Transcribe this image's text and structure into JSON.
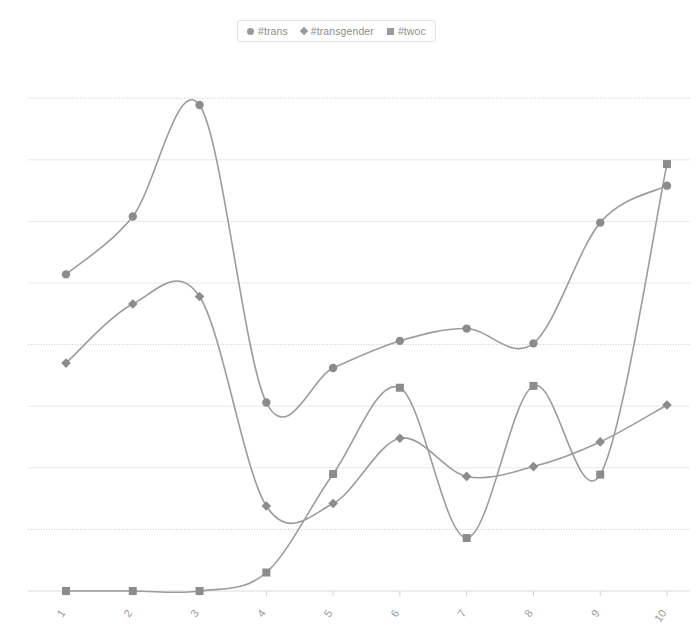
{
  "chart_data": {
    "type": "line",
    "title": "",
    "subtitle": "",
    "xlabel": "",
    "ylabel": "",
    "x": [
      1,
      2,
      3,
      4,
      5,
      6,
      7,
      8,
      9,
      10
    ],
    "categories": [
      "1",
      "2",
      "3",
      "4",
      "5",
      "6",
      "7",
      "8",
      "9",
      "10"
    ],
    "xlim": [
      1,
      10
    ],
    "ylim": [
      0,
      8
    ],
    "grid": true,
    "gridlines_y": [
      0,
      1,
      2,
      3,
      4,
      5,
      6,
      7,
      8
    ],
    "y_tick_labels_visible": false,
    "legend_position": "top-center",
    "series": [
      {
        "name": "#trans",
        "marker": "circle",
        "color": "#9c9c9c",
        "values": [
          5.14,
          6.08,
          7.89,
          3.06,
          3.62,
          4.06,
          4.26,
          4.02,
          5.98,
          6.58
        ]
      },
      {
        "name": "#transgender",
        "marker": "diamond",
        "color": "#9c9c9c",
        "values": [
          3.7,
          4.66,
          4.78,
          1.38,
          1.42,
          2.48,
          1.86,
          2.02,
          2.42,
          3.02
        ]
      },
      {
        "name": "#twoc",
        "marker": "square",
        "color": "#9c9c9c",
        "values": [
          0.0,
          0.0,
          0.0,
          0.3,
          1.9,
          3.3,
          0.86,
          3.33,
          1.89,
          6.93
        ]
      }
    ]
  },
  "legend": {
    "items": [
      {
        "label": "#trans",
        "marker": "circle-marker-icon"
      },
      {
        "label": "#transgender",
        "marker": "diamond-marker-icon"
      },
      {
        "label": "#twoc",
        "marker": "square-marker-icon"
      }
    ]
  },
  "axis": {
    "x_tick_labels": [
      "1",
      "2",
      "3",
      "4",
      "5",
      "6",
      "7",
      "8",
      "9",
      "10"
    ]
  },
  "colors": {
    "series": "#9c9c9c",
    "marker": "#8c8c8c",
    "grid": "#e8e8ee",
    "grid_dotted": "#c9c9cf",
    "axis": "#dcdcdc",
    "text": "#9b9b9b",
    "legend_border": "#e2e2e2",
    "background": "#ffffff"
  }
}
